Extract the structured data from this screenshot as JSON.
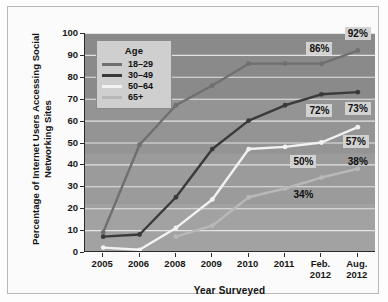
{
  "chart_data": {
    "type": "line",
    "title": "",
    "xlabel": "Year Surveyed",
    "ylabel": "Percentage of Internet Users Accessing Social Networking Sites",
    "categories": [
      "2005",
      "2006",
      "2008",
      "2009",
      "2010",
      "2011",
      "Feb. 2012",
      "Aug. 2012"
    ],
    "category_lines": [
      [
        "2005"
      ],
      [
        "2006"
      ],
      [
        "2008"
      ],
      [
        "2009"
      ],
      [
        "2010"
      ],
      [
        "2011"
      ],
      [
        "Feb.",
        "2012"
      ],
      [
        "Aug.",
        "2012"
      ]
    ],
    "ylim": [
      0,
      100
    ],
    "yticks": [
      0,
      10,
      20,
      30,
      40,
      50,
      60,
      70,
      80,
      90,
      100
    ],
    "grid": true,
    "legend_position": "upper-left",
    "legend_title": "Age",
    "series": [
      {
        "name": "18-29",
        "color": "#6f6f6f",
        "values": [
          9,
          49,
          67,
          76,
          86,
          86,
          86,
          92
        ]
      },
      {
        "name": "30-49",
        "color": "#3a3a3a",
        "values": [
          7,
          8,
          25,
          47,
          60,
          67,
          72,
          73
        ]
      },
      {
        "name": "50-64",
        "color": "#f2f2f2",
        "values": [
          2,
          1,
          11,
          24,
          47,
          48,
          50,
          57
        ]
      },
      {
        "name": "65+",
        "color": "#b8b8b8",
        "values": [
          null,
          null,
          7,
          12,
          25,
          29,
          34,
          38
        ]
      }
    ],
    "annotations": [
      {
        "text": "86%",
        "series": "18-29",
        "category": "Feb. 2012"
      },
      {
        "text": "92%",
        "series": "18-29",
        "category": "Aug. 2012"
      },
      {
        "text": "72%",
        "series": "30-49",
        "category": "Feb. 2012"
      },
      {
        "text": "73%",
        "series": "30-49",
        "category": "Aug. 2012"
      },
      {
        "text": "50%",
        "series": "50-64",
        "category": "Feb. 2012"
      },
      {
        "text": "57%",
        "series": "50-64",
        "category": "Aug. 2012"
      },
      {
        "text": "34%",
        "series": "65+",
        "category": "Feb. 2012"
      },
      {
        "text": "38%",
        "series": "65+",
        "category": "Aug. 2012"
      }
    ]
  }
}
